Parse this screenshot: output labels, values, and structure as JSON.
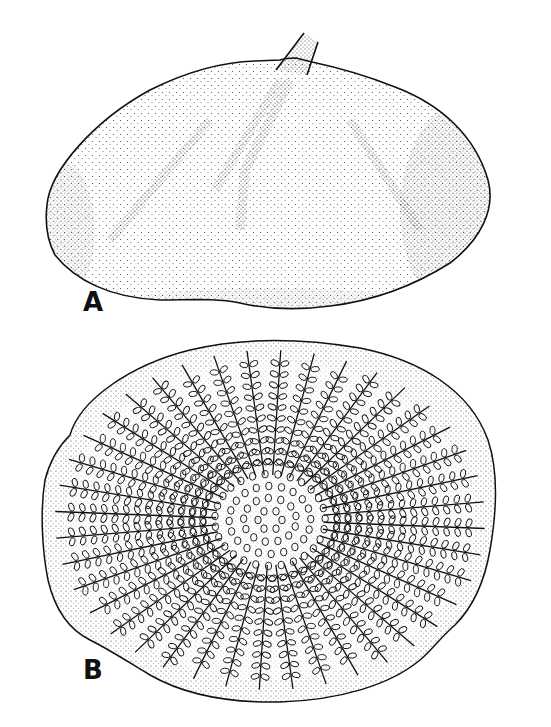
{
  "figure": {
    "panels": [
      {
        "id": "A",
        "label": "A",
        "view": "side view, dome-shaped body with stalk"
      },
      {
        "id": "B",
        "label": "B",
        "view": "basal view, radiating pinnate rows around central zone"
      }
    ]
  },
  "colors": {
    "ink": "#111111",
    "stipple": "#3a3a3a",
    "background": "#ffffff"
  }
}
